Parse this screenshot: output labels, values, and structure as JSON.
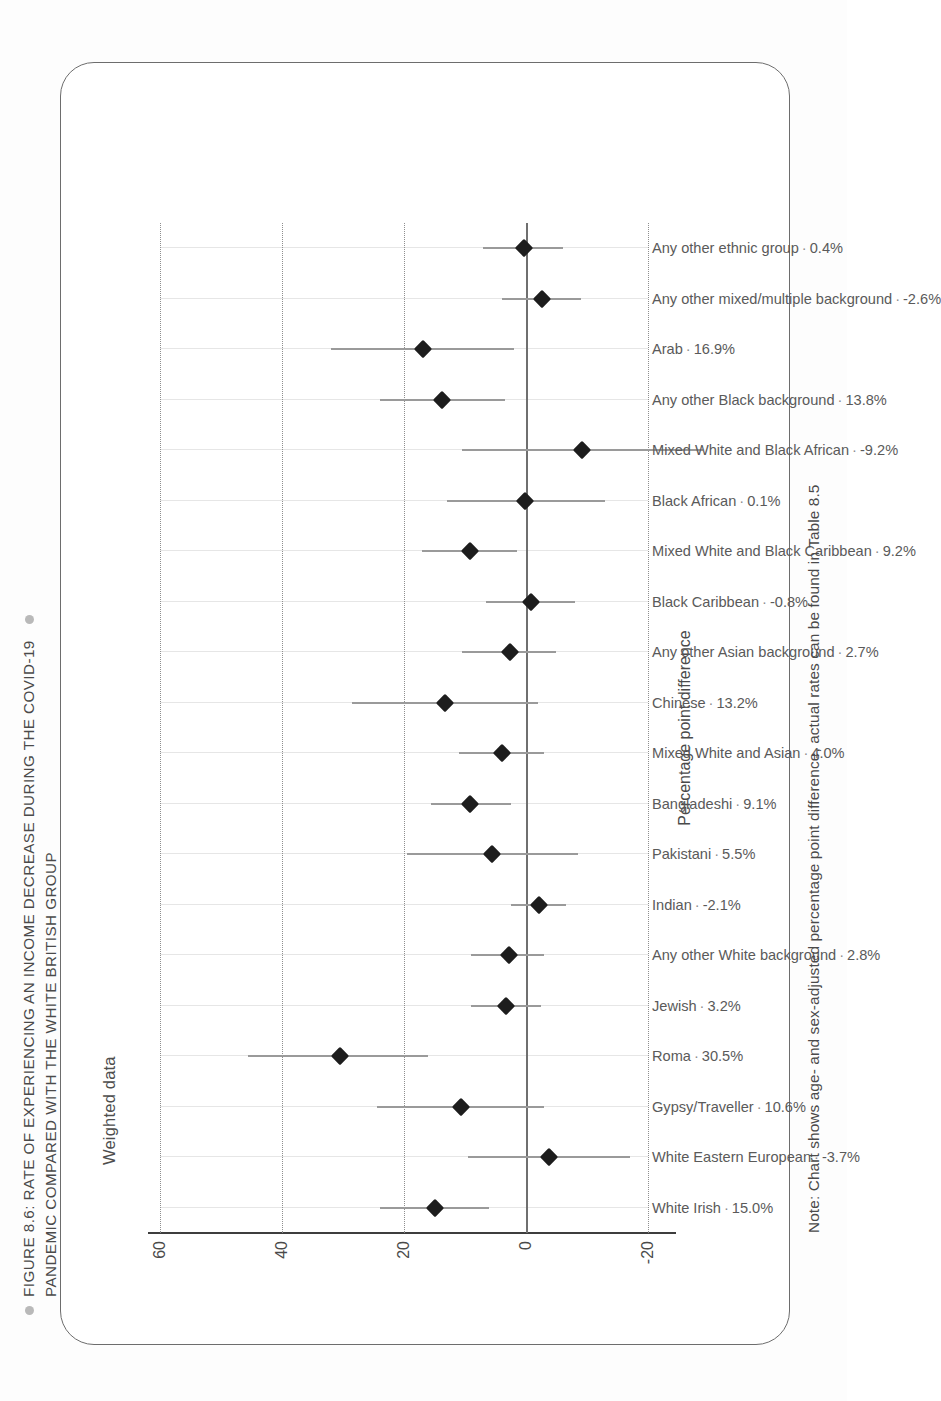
{
  "figure": {
    "title_line1": "FIGURE 8.6: RATE OF EXPERIENCING AN INCOME DECREASE DURING THE COVID-19",
    "title_line2": "PANDEMIC COMPARED WITH THE WHITE BRITISH GROUP",
    "subtitle": "Weighted data",
    "note": "Note: Chart shows age- and sex-adjusted percentage point difference, actual rates can be found in Table 8.5",
    "accent_color": "#b9b9b9",
    "dot_color": "#1d1d1d",
    "ci_color": "#9a9a9a",
    "border_color": "#6d6d6d"
  },
  "chart_data": {
    "type": "scatter",
    "title": "FIGURE 8.6: RATE OF EXPERIENCING AN INCOME DECREASE DURING THE COVID-19 PANDEMIC COMPARED WITH THE WHITE BRITISH GROUP",
    "subtitle": "Weighted data",
    "xlabel": "",
    "ylabel": "Percentage point difference",
    "ylim": [
      -20,
      60
    ],
    "yticks": [
      -20,
      0,
      20,
      40,
      60
    ],
    "ytick_labels": [
      "-20",
      "0",
      "20",
      "40",
      "60"
    ],
    "grid": "horizontal-dotted",
    "legend": "none",
    "reference_line": 0,
    "categories": [
      "White Irish",
      "White Eastern European",
      "Gypsy/Traveller",
      "Roma",
      "Jewish",
      "Any other White background",
      "Indian",
      "Pakistani",
      "Bangladeshi",
      "Mixed White and Asian",
      "Chinese",
      "Any other Asian background",
      "Black Caribbean",
      "Mixed White and Black Caribbean",
      "Black African",
      "Mixed White and Black African",
      "Any other Black background",
      "Arab",
      "Any other mixed/multiple background",
      "Any other ethnic group"
    ],
    "value_labels": [
      "15.0%",
      "-3.7%",
      "10.6%",
      "30.5%",
      "3.2%",
      "2.8%",
      "-2.1%",
      "5.5%",
      "9.1%",
      "4.0%",
      "13.2%",
      "2.7%",
      "-0.8%",
      "9.2%",
      "0.1%",
      "-9.2%",
      "13.8%",
      "16.9%",
      "-2.6%",
      "0.4%"
    ],
    "values": [
      15.0,
      -3.7,
      10.6,
      30.5,
      3.2,
      2.8,
      -2.1,
      5.5,
      9.1,
      4.0,
      13.2,
      2.7,
      -0.8,
      9.2,
      0.1,
      -9.2,
      13.8,
      16.9,
      -2.6,
      0.4
    ],
    "ci_low": [
      6.0,
      -17.0,
      -3.0,
      16.0,
      -2.5,
      -3.0,
      -6.5,
      -8.5,
      2.5,
      -3.0,
      -2.0,
      -5.0,
      -8.0,
      1.5,
      -13.0,
      -29.0,
      3.5,
      2.0,
      -9.0,
      -6.0
    ],
    "ci_high": [
      24.0,
      9.5,
      24.5,
      45.5,
      9.0,
      9.0,
      2.5,
      19.5,
      15.5,
      11.0,
      28.5,
      10.5,
      6.5,
      17.0,
      13.0,
      10.5,
      24.0,
      32.0,
      4.0,
      7.0
    ]
  },
  "axis": {
    "y_title": "Percentage point difference"
  }
}
